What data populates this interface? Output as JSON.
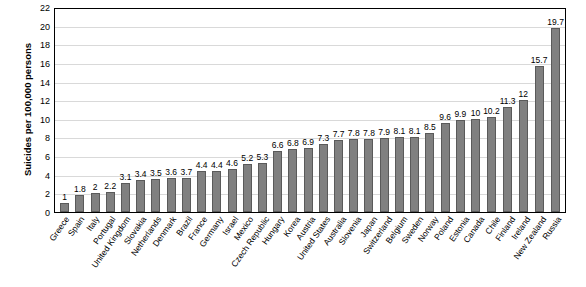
{
  "chart_data": {
    "type": "bar",
    "title": "",
    "xlabel": "",
    "ylabel": "Suicides per 100,000 persons",
    "ylim": [
      0,
      22
    ],
    "ytick_step": 2,
    "yticks": [
      0,
      2,
      4,
      6,
      8,
      10,
      12,
      14,
      16,
      18,
      20,
      22
    ],
    "grid": true,
    "legend": "none",
    "bar_color": "#808080",
    "categories": [
      "Greece",
      "Spain",
      "Italy",
      "Portugal",
      "United Kingdom",
      "Slovakia",
      "Netherlands",
      "Denmark",
      "Brazil",
      "France",
      "Germany",
      "Israel",
      "Mexico",
      "Czech Republic",
      "Hungary",
      "Korea",
      "Austria",
      "United States",
      "Australia",
      "Slovenia",
      "Japan",
      "Switzerland",
      "Belgium",
      "Sweden",
      "Norway",
      "Poland",
      "Estonia",
      "Canada",
      "Chile",
      "Finland",
      "Ireland",
      "New Zealand",
      "Russia"
    ],
    "values": [
      1,
      1.8,
      2,
      2.2,
      3.1,
      3.4,
      3.5,
      3.6,
      3.7,
      4.4,
      4.4,
      4.6,
      5.2,
      5.3,
      6.6,
      6.8,
      6.9,
      7.3,
      7.7,
      7.8,
      7.8,
      7.9,
      8.1,
      8.1,
      8.5,
      9.6,
      9.9,
      10,
      10.2,
      11.3,
      12,
      15.7,
      19.7
    ],
    "value_labels": [
      "1",
      "1.8",
      "2",
      "2.2",
      "3.1",
      "3.4",
      "3.5",
      "3.6",
      "3.7",
      "4.4",
      "4.4",
      "4.6",
      "5.2",
      "5.3",
      "6.6",
      "6.8",
      "6.9",
      "7.3",
      "7.7",
      "7.8",
      "7.8",
      "7.9",
      "8.1",
      "8.1",
      "8.5",
      "9.6",
      "9.9",
      "10",
      "10.2",
      "11.3",
      "12",
      "15.7",
      "19.7"
    ]
  }
}
